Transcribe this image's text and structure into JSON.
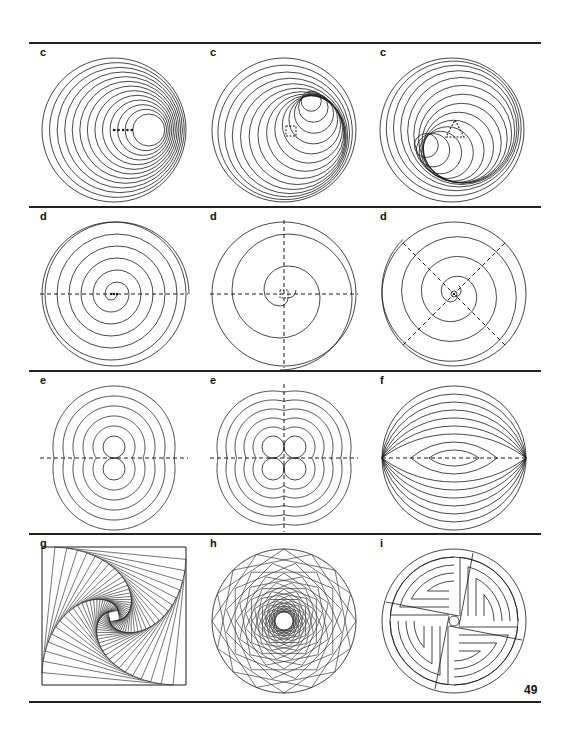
{
  "page": {
    "page_number": "49",
    "ink_color": "#1a1a1a",
    "background_color": "#ffffff"
  },
  "figures": [
    {
      "label": "c",
      "description": "eccentric circles around a 5-point line generator"
    },
    {
      "label": "c",
      "description": "eccentric circles around a square generator"
    },
    {
      "label": "c",
      "description": "eccentric circles around a triangle generator"
    },
    {
      "label": "d",
      "description": "two-centre spiral with horizontal dashed axis"
    },
    {
      "label": "d",
      "description": "four-centre spiral with dashed cross axes"
    },
    {
      "label": "d",
      "description": "spiral with diagonal dashed axes"
    },
    {
      "label": "e",
      "description": "concentric curves around two tangent circles"
    },
    {
      "label": "e",
      "description": "concentric curves around four tangent circles"
    },
    {
      "label": "f",
      "description": "nested lens arcs through common endpoints"
    },
    {
      "label": "g",
      "description": "whirling squares built from straight lines"
    },
    {
      "label": "h",
      "description": "rotating polygons inscribed in a circle"
    },
    {
      "label": "i",
      "description": "interlocking four-armed circular knot"
    }
  ]
}
